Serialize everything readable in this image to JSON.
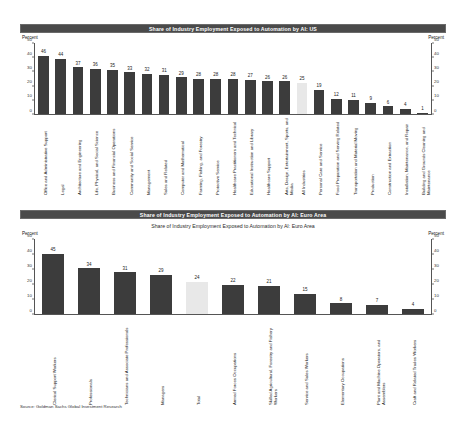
{
  "source_note": "Source: Goldman Sachs Global Investment Research",
  "colors": {
    "bar": "#3c3c3c",
    "highlight_bar": "#e8e8e8",
    "title_bar": "#4a4a4a",
    "title_text": "#ffffff"
  },
  "panels": [
    {
      "id": "us",
      "title": "Share of Industry Employment Exposed to Automation by AI: US",
      "axis_caption_left": "Percent",
      "axis_caption_right": "Percent",
      "chart_data": {
        "type": "bar",
        "title": "Share of Industry Employment Exposed to Automation by AI: US",
        "xlabel": "",
        "ylabel": "Percent",
        "ylim": [
          0,
          50
        ],
        "yticks": [
          0,
          10,
          20,
          30,
          40,
          50
        ],
        "grid": false,
        "legend": "none",
        "highlight_category": "All Industries",
        "categories": [
          "Office and Administrative Support",
          "Legal",
          "Architecture and Engineering",
          "Life, Physical, and Social Science",
          "Business and Financial Operations",
          "Community and Social Service",
          "Management",
          "Sales and Related",
          "Computer and Mathematical",
          "Farming, Fishing, and Forestry",
          "Protective Service",
          "Healthcare Practitioners and Technical",
          "Educational Instruction and Library",
          "Healthcare Support",
          "Arts, Design, Entertainment, Sports, and Media",
          "All Industries",
          "Personal Care and Service",
          "Food Preparation and Serving Related",
          "Transportation and Material Moving",
          "Production",
          "Construction and Extraction",
          "Installation, Maintenance, and Repair",
          "Building and Grounds Cleaning and Maintenance"
        ],
        "values": [
          46,
          44,
          37,
          36,
          35,
          33,
          32,
          31,
          29,
          28,
          28,
          28,
          27,
          26,
          26,
          25,
          19,
          12,
          11,
          9,
          6,
          4,
          1
        ]
      }
    },
    {
      "id": "ea",
      "title": "Share of Industry Employment Exposed to Automation by AI: Euro Area",
      "subtitle": "Share of Industry Employment Exposed to Automation by AI: Euro Area",
      "axis_caption_left": "Percent",
      "axis_caption_right": "Percent",
      "chart_data": {
        "type": "bar",
        "title": "Share of Industry Employment Exposed to Automation by AI: Euro Area",
        "xlabel": "",
        "ylabel": "Percent",
        "ylim": [
          0,
          50
        ],
        "yticks": [
          0,
          10,
          20,
          30,
          40,
          50
        ],
        "grid": false,
        "legend": "none",
        "highlight_category": "Total",
        "categories": [
          "Clerical Support Workers",
          "Professionals",
          "Technicians and Associate Professionals",
          "Managers",
          "Total",
          "Armed Forces Occupations",
          "Skilled Agricultural, Forestry and Fishery Workers",
          "Service and Sales Workers",
          "Elementary Occupations",
          "Plant and Machine Operators, and Assemblers",
          "Craft and Related Trades Workers"
        ],
        "values": [
          45,
          34,
          31,
          29,
          24,
          22,
          21,
          15,
          8,
          7,
          4
        ]
      }
    }
  ]
}
